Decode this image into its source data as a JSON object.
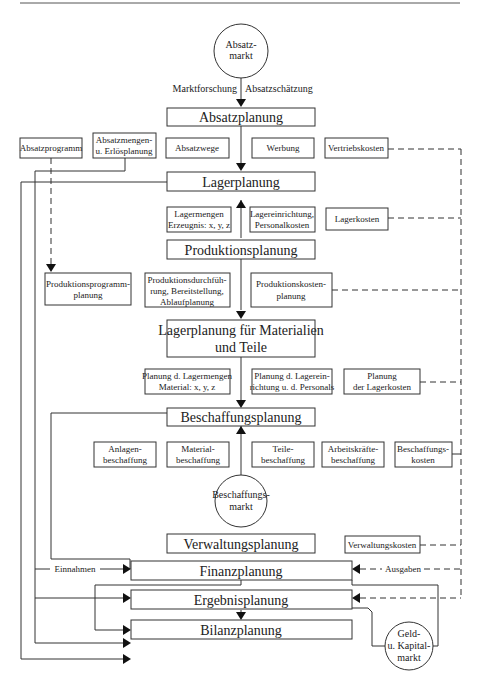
{
  "diagram": {
    "circles": {
      "absatzmarkt": [
        "Absatz-",
        "markt"
      ],
      "beschaffungsmarkt": [
        "Beschaffungs-",
        "markt"
      ],
      "geldmarkt": [
        "Geld-",
        "u. Kapital-",
        "markt"
      ]
    },
    "edge_labels": {
      "marktforschung": "Marktforschung",
      "absatzschaetzung": "Absatzschätzung",
      "einnahmen": "Einnahmen",
      "ausgaben": "Ausgaben"
    },
    "main_boxes": {
      "absatzplanung": "Absatzplanung",
      "lagerplanung": "Lagerplanung",
      "produktionsplanung": "Produktionsplanung",
      "lagerplanung_material": [
        "Lagerplanung für Materialien",
        "und Teile"
      ],
      "beschaffungsplanung": "Beschaffungsplanung",
      "verwaltungsplanung": "Verwaltungsplanung",
      "finanzplanung": "Finanzplanung",
      "ergebnisplanung": "Ergebnisplanung",
      "bilanzplanung": "Bilanzplanung"
    },
    "absatz_sub": [
      [
        "Absatzprogramm"
      ],
      [
        "Absatzmengen-",
        "u. Erlösplanung"
      ],
      [
        "Absatzwege"
      ],
      [
        "Werbung"
      ],
      [
        "Vertriebskosten"
      ]
    ],
    "lager_sub": [
      [
        "Lagermengen",
        "Erzeugnis: x, y, z"
      ],
      [
        "Lagereinrichtung,",
        "Personalkosten"
      ],
      [
        "Lagerkosten"
      ]
    ],
    "produktion_sub": [
      [
        "Produktionsprogramm-",
        "planung"
      ],
      [
        "Produktionsdurchfüh-",
        "rung, Bereitstellung,",
        "Ablaufplanung"
      ],
      [
        "Produktionskosten-",
        "planung"
      ]
    ],
    "lagermat_sub": [
      [
        "Planung d. Lagermengen",
        "Material: x, y, z"
      ],
      [
        "Planung d. Lagerein-",
        "richtung u. d. Personals"
      ],
      [
        "Planung",
        "der Lagerkosten"
      ]
    ],
    "beschaffung_sub": [
      [
        "Anlagen-",
        "beschaffung"
      ],
      [
        "Material-",
        "beschaffung"
      ],
      [
        "Teile-",
        "beschaffung"
      ],
      [
        "Arbeitskräfte-",
        "beschaffung"
      ],
      [
        "Beschaffungs-",
        "kosten"
      ]
    ],
    "verwaltung_sub": [
      "Verwaltungskosten"
    ]
  }
}
